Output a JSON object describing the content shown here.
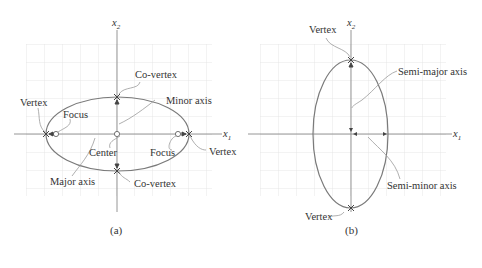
{
  "colors": {
    "grid": "#e2e2e2",
    "axis": "#8a8a8a",
    "ellipse": "#7a7a7a",
    "leader": "#9a9a9a",
    "marker": "#444444",
    "text": "#333333"
  },
  "panel_a": {
    "caption": "(a)",
    "axis_x_label": "x",
    "axis_x_sub": "1",
    "axis_y_label": "x",
    "axis_y_sub": "2",
    "labels": {
      "vertex_left": "Vertex",
      "vertex_right": "Vertex",
      "focus_left": "Focus",
      "focus_right": "Focus",
      "co_vertex_top": "Co-vertex",
      "co_vertex_bottom": "Co-vertex",
      "minor_axis": "Minor axis",
      "major_axis": "Major axis",
      "center": "Center"
    }
  },
  "panel_b": {
    "caption": "(b)",
    "axis_x_label": "x",
    "axis_x_sub": "1",
    "axis_y_label": "x",
    "axis_y_sub": "2",
    "labels": {
      "vertex_top": "Vertex",
      "vertex_bottom": "Vertex",
      "semi_major_axis": "Semi-major axis",
      "semi_minor_axis": "Semi-minor axis"
    }
  }
}
